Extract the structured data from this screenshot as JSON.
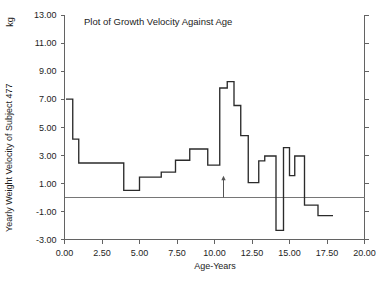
{
  "figure": {
    "unit_label": "kg",
    "bottom_cutoff_text": "",
    "axis_color": "#636363",
    "data_color": "#2b2b2b",
    "zero_line_color": "#767676"
  },
  "chart_data": {
    "type": "line",
    "subtype": "step",
    "title": "Plot of Growth Velocity Against Age",
    "xlabel": "Age-Years",
    "ylabel": "Yearly Weight Velocity of Subject 477",
    "yunit": "kg",
    "xlim": [
      0.0,
      20.0
    ],
    "ylim": [
      -3.0,
      13.0
    ],
    "grid": false,
    "legend": false,
    "zero_reference_line": 0.0,
    "xticks": [
      0.0,
      2.5,
      5.0,
      7.5,
      10.0,
      12.5,
      15.0,
      17.5,
      20.0
    ],
    "xtick_labels": [
      "0.00",
      "2.50",
      "5.00",
      "7.50",
      "10.00",
      "12.50",
      "15.00",
      "17.50",
      "20.00"
    ],
    "yticks": [
      -3.0,
      -1.0,
      1.0,
      3.0,
      5.0,
      7.0,
      9.0,
      11.0,
      13.0
    ],
    "ytick_labels": [
      "-3.00",
      "-1.00",
      "1.00",
      "3.00",
      "5.00",
      "7.00",
      "9.00",
      "11.00",
      "13.00"
    ],
    "annotations": [
      {
        "type": "arrow",
        "label": "",
        "x": 10.6,
        "y_from": 0.0,
        "y_to": 1.55
      }
    ],
    "steps": [
      {
        "x_start": 0.1,
        "x_end": 0.55,
        "value": 7.0
      },
      {
        "x_start": 0.55,
        "x_end": 0.95,
        "value": 4.15
      },
      {
        "x_start": 0.95,
        "x_end": 3.95,
        "value": 2.45
      },
      {
        "x_start": 3.95,
        "x_end": 5.0,
        "value": 0.5
      },
      {
        "x_start": 5.0,
        "x_end": 6.45,
        "value": 1.45
      },
      {
        "x_start": 6.45,
        "x_end": 7.4,
        "value": 1.8
      },
      {
        "x_start": 7.4,
        "x_end": 8.35,
        "value": 2.65
      },
      {
        "x_start": 8.35,
        "x_end": 9.55,
        "value": 3.45
      },
      {
        "x_start": 9.55,
        "x_end": 10.35,
        "value": 2.3
      },
      {
        "x_start": 10.35,
        "x_end": 10.85,
        "value": 7.8
      },
      {
        "x_start": 10.85,
        "x_end": 11.3,
        "value": 8.25
      },
      {
        "x_start": 11.3,
        "x_end": 11.75,
        "value": 6.55
      },
      {
        "x_start": 11.75,
        "x_end": 12.25,
        "value": 4.4
      },
      {
        "x_start": 12.25,
        "x_end": 12.95,
        "value": 1.05
      },
      {
        "x_start": 12.95,
        "x_end": 13.35,
        "value": 2.6
      },
      {
        "x_start": 13.35,
        "x_end": 14.1,
        "value": 2.95
      },
      {
        "x_start": 14.1,
        "x_end": 14.6,
        "value": -2.35
      },
      {
        "x_start": 14.6,
        "x_end": 15.0,
        "value": 3.55
      },
      {
        "x_start": 15.0,
        "x_end": 15.35,
        "value": 1.55
      },
      {
        "x_start": 15.35,
        "x_end": 16.0,
        "value": 2.95
      },
      {
        "x_start": 16.0,
        "x_end": 16.9,
        "value": -0.55
      },
      {
        "x_start": 16.9,
        "x_end": 17.9,
        "value": -1.3
      }
    ]
  }
}
